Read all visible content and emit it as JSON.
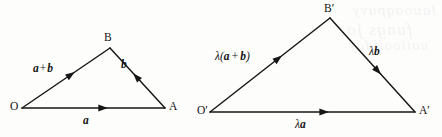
{
  "figure": {
    "kind": "vector-triangle-similarity-diagram",
    "background_color": "#fdfdfc",
    "ink_color": "#161616",
    "bleed_through_lines": [
      "lauooqpuvy",
      "fungs jo",
      "uoiiooijddy"
    ]
  },
  "diagrams": [
    {
      "id": "left",
      "name": "triangle-oab",
      "vertices": [
        {
          "name": "O",
          "label": "O",
          "x": 22,
          "y": 108
        },
        {
          "name": "A",
          "label": "A",
          "x": 165,
          "y": 108
        },
        {
          "name": "B",
          "label": "B",
          "x": 110,
          "y": 48
        }
      ],
      "edges": [
        {
          "name": "base",
          "from": "O",
          "to": "A",
          "label": "a",
          "label_x": 86,
          "label_y": 116,
          "arrow_t": 0.56
        },
        {
          "name": "right-side",
          "from": "A",
          "to": "B",
          "label": "b",
          "label_x": 123,
          "label_y": 62,
          "arrow_t": 0.55
        },
        {
          "name": "left-side",
          "from": "O",
          "to": "B",
          "label": "a + b",
          "label_x": 35,
          "label_y": 66,
          "arrow_t": 0.58
        }
      ]
    },
    {
      "id": "right",
      "name": "triangle-oab-prime",
      "vertices": [
        {
          "name": "O-prime",
          "label": "O′",
          "x": 210,
          "y": 112
        },
        {
          "name": "A-prime",
          "label": "A′",
          "x": 415,
          "y": 112
        },
        {
          "name": "B-prime",
          "label": "B′",
          "x": 330,
          "y": 18
        }
      ],
      "edges": [
        {
          "name": "base",
          "from": "O-prime",
          "to": "A-prime",
          "label_lambda": "λ",
          "label_vector": "a",
          "label_x": 298,
          "label_y": 122,
          "arrow_t": 0.56
        },
        {
          "name": "right-side",
          "from": "B-prime",
          "to": "A-prime",
          "label_lambda": "λ",
          "label_vector": "b",
          "label_x": 372,
          "label_y": 50,
          "arrow_t": 0.56
        },
        {
          "name": "left-side",
          "from": "O-prime",
          "to": "B-prime",
          "label_lambda": "λ",
          "label_open": "(",
          "label_vector_1": "a",
          "label_op": "+",
          "label_vector_2": "b",
          "label_close": ")",
          "label_x": 217,
          "label_y": 54,
          "arrow_t": 0.58
        }
      ]
    }
  ],
  "labels": {
    "left": {
      "vertex_o": "O",
      "vertex_a": "A",
      "vertex_b": "B",
      "vec_a": "a",
      "vec_b": "b",
      "vec_a_plus_b_first": "a",
      "vec_a_plus_b_op": "+",
      "vec_a_plus_b_second": "b"
    },
    "right": {
      "vertex_o_prime": "O′",
      "vertex_a_prime": "A′",
      "vertex_b_prime": "B′",
      "lambda": "λ",
      "vec_a": "a",
      "vec_b": "b",
      "paren_open": "(",
      "paren_close": ")",
      "plus": "+"
    }
  }
}
